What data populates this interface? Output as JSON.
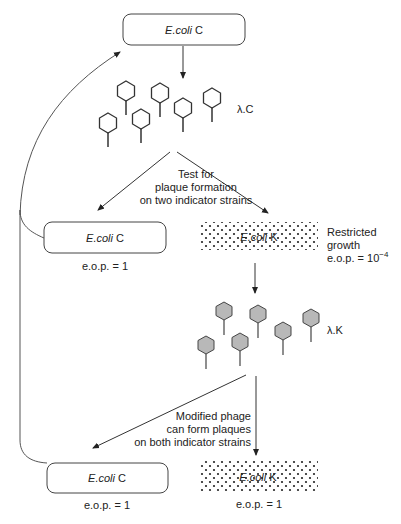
{
  "diagram": {
    "top_box": {
      "species": "E.coli",
      "strain": " C"
    },
    "phage_c_label": "λ.C",
    "test_text": [
      "Test for",
      "plaque formation",
      "on two indicator strains"
    ],
    "mid_left_box": {
      "species": "E.coli",
      "strain": " C",
      "eop": "e.o.p. = 1"
    },
    "mid_right_box": {
      "species": "E.coli",
      "strain": " K"
    },
    "restricted_text": [
      "Restricted",
      "growth"
    ],
    "restricted_eop": {
      "prefix": "e.o.p. = 10",
      "exponent": "−4"
    },
    "phage_k_label": "λ.K",
    "modified_text": [
      "Modified phage",
      "can form  plaques",
      "on both indicator strains"
    ],
    "bottom_left_box": {
      "species": "E.coli",
      "strain": " C",
      "eop": "e.o.p. = 1"
    },
    "bottom_right_box": {
      "species": "E.coli",
      "strain": " K",
      "eop": "e.o.p. = 1"
    },
    "colors": {
      "line": "#333333",
      "phage_k_fill": "#b8b8b8",
      "dots": "#222222"
    }
  }
}
